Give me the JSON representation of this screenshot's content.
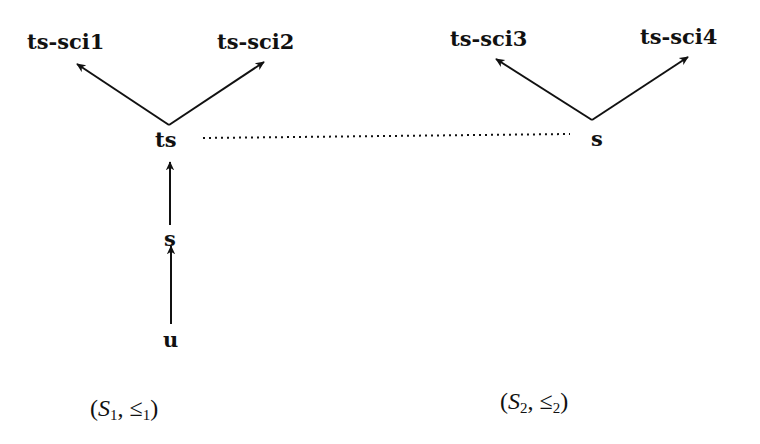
{
  "diagram": {
    "poset1": {
      "nodes": {
        "ts_sci1": "ts-sci1",
        "ts_sci2": "ts-sci2",
        "ts": "ts",
        "s": "s",
        "u": "u"
      },
      "caption": {
        "open": "(",
        "set": "S",
        "set_sub": "1",
        "sep": ", ",
        "rel": "≤",
        "rel_sub": "1",
        "close": ")"
      }
    },
    "poset2": {
      "nodes": {
        "ts_sci3": "ts-sci3",
        "ts_sci4": "ts-sci4",
        "s": "s"
      },
      "caption": {
        "open": "(",
        "set": "S",
        "set_sub": "2",
        "sep": ", ",
        "rel": "≤",
        "rel_sub": "2",
        "close": ")"
      }
    },
    "edges": [
      {
        "from": "u",
        "to": "s",
        "poset": 1
      },
      {
        "from": "s",
        "to": "ts",
        "poset": 1
      },
      {
        "from": "ts",
        "to": "ts-sci1",
        "poset": 1
      },
      {
        "from": "ts",
        "to": "ts-sci2",
        "poset": 1
      },
      {
        "from": "s",
        "to": "ts-sci3",
        "poset": 2
      },
      {
        "from": "s",
        "to": "ts-sci4",
        "poset": 2
      }
    ],
    "dotted_link": {
      "from": "ts (S1)",
      "to": "s (S2)"
    }
  }
}
